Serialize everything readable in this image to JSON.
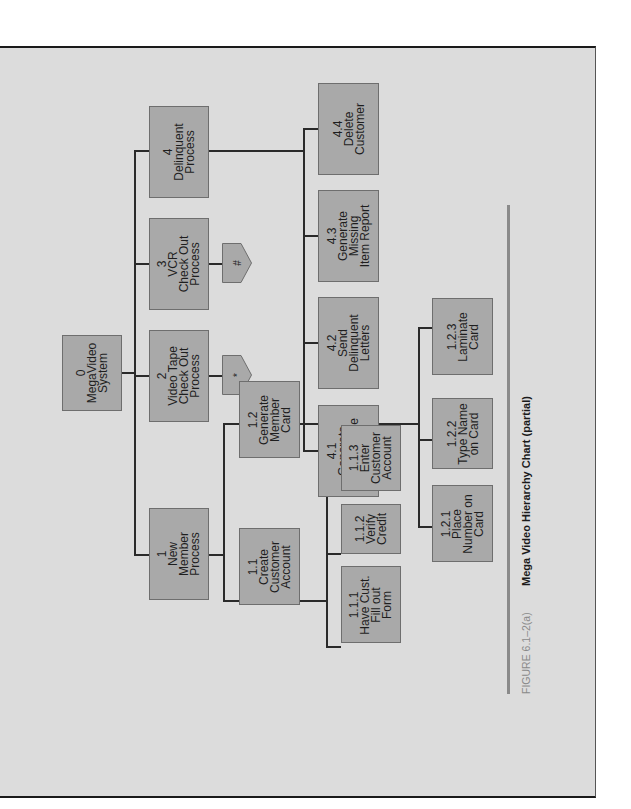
{
  "figure": {
    "number": "FIGURE 6.1–2(a)",
    "title": "Mega Video Hierarchy Chart (partial)"
  },
  "colors": {
    "page": "#dcdcdc",
    "box": "#a9a9a9",
    "line": "#2a2a2a"
  },
  "chart": {
    "root": {
      "id": "0",
      "label": "MegaVideo\nSystem"
    },
    "level1": [
      {
        "id": "1",
        "label": "New\nMember\nProcess"
      },
      {
        "id": "2",
        "label": "Video Tape\nCheck Out\nProcess",
        "connector": "*"
      },
      {
        "id": "3",
        "label": "VCR\nCheck Out\nProcess",
        "connector": "#"
      },
      {
        "id": "4",
        "label": "Delinquent\nProcess"
      }
    ],
    "level2": [
      {
        "id": "1.1",
        "label": "Create\nCustomer\nAccount"
      },
      {
        "id": "1.2",
        "label": "Generate\nMember\nCard"
      },
      {
        "id": "4.1",
        "label": "Generate\nLate Charge\nReport"
      },
      {
        "id": "4.2",
        "label": "Send\nDelinquent\nLetters"
      },
      {
        "id": "4.3",
        "label": "Generate\nMissing\nItem Report"
      },
      {
        "id": "4.4",
        "label": "Delete\nCustomer"
      }
    ],
    "level3": [
      {
        "id": "1.1.1",
        "label": "Have Cust.\nFill out\nForm"
      },
      {
        "id": "1.1.2",
        "label": "Verify\nCredit"
      },
      {
        "id": "1.1.3",
        "label": "Enter\nCustomer\nAccount"
      },
      {
        "id": "1.2.1",
        "label": "Place\nNumber on\nCard"
      },
      {
        "id": "1.2.2",
        "label": "Type Name\non Card"
      },
      {
        "id": "1.2.3",
        "label": "Laminate\nCard"
      }
    ]
  },
  "texts": {
    "b0": "0\nMegaVideo\nSystem",
    "b1": "1\nNew\nMember\nProcess",
    "b2": "2\nVideo Tape\nCheck Out\nProcess",
    "b3": "3\nVCR\nCheck Out\nProcess",
    "b4": "4\nDelinquent\nProcess",
    "b11": "1.1\nCreate\nCustomer\nAccount",
    "b12": "1.2\nGenerate\nMember\nCard",
    "b41": "4.1\nGenerate\nLate Charge\nReport",
    "b42": "4.2\nSend\nDelinquent\nLetters",
    "b43": "4.3\nGenerate\nMissing\nItem Report",
    "b44": "4.4\nDelete\nCustomer",
    "b111": "1.1.1\nHave Cust.\nFill out\nForm",
    "b112": "1.1.2\nVerify\nCredit",
    "b113": "1.1.3\nEnter\nCustomer\nAccount",
    "b121": "1.2.1\nPlace\nNumber on\nCard",
    "b122": "1.2.2\nType Name\non Card",
    "b123": "1.2.3\nLaminate\nCard",
    "p2": "*",
    "p3": "#"
  }
}
